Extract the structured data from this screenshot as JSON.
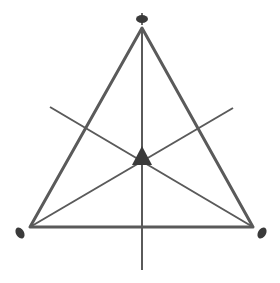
{
  "diagram": {
    "type": "triangle-with-medians",
    "colors": {
      "triangle_stroke": "#5a5a5a",
      "line_stroke": "#5a5a5a",
      "fill": "#3a3a3a",
      "background": "#ffffff"
    },
    "vertices": {
      "top": [
        142,
        28
      ],
      "bottom_left": [
        30,
        227
      ],
      "bottom_right": [
        253,
        227
      ]
    },
    "centroid": [
      142,
      158
    ],
    "lines": [
      {
        "name": "vertical-axis",
        "from": [
          142,
          28
        ],
        "to": [
          142,
          270
        ]
      },
      {
        "name": "median-from-bottom-left",
        "from": [
          30,
          227
        ],
        "to": [
          233,
          108
        ]
      },
      {
        "name": "median-from-bottom-right",
        "from": [
          253,
          227
        ],
        "to": [
          50,
          107
        ]
      }
    ]
  }
}
